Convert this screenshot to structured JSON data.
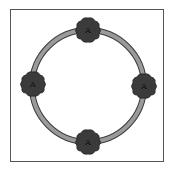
{
  "diagram": {
    "type": "ring-network",
    "ring": {
      "cx": 88,
      "cy": 86,
      "r": 56,
      "color": "#9a9a9a",
      "edge": "#3a3a3a"
    },
    "node_color": "#3b3b3b",
    "nodes": [
      {
        "id": "top",
        "label": "A",
        "x": 88,
        "y": 30
      },
      {
        "id": "right",
        "label": "A",
        "x": 144,
        "y": 86
      },
      {
        "id": "bottom",
        "label": "A",
        "x": 88,
        "y": 142
      },
      {
        "id": "left",
        "label": "A",
        "x": 33,
        "y": 84
      }
    ]
  }
}
